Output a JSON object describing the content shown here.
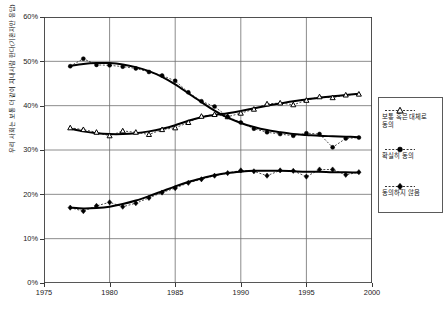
{
  "chart_data": {
    "type": "line",
    "title": "",
    "subtitle": "",
    "xlabel": "",
    "ylabel": "우리 사회는 보통 더 같이 지내사람 한다(기혼자만 응답)",
    "xlim": [
      1975,
      2000
    ],
    "ylim": [
      0,
      60
    ],
    "yticks": [
      0,
      10,
      20,
      30,
      40,
      50,
      60
    ],
    "ytick_labels": [
      "0%",
      "10%",
      "20%",
      "30%",
      "40%",
      "50%",
      "60%"
    ],
    "xticks": [
      1975,
      1980,
      1985,
      1990,
      1995,
      2000
    ],
    "xtick_labels": [
      "1975",
      "1980",
      "1985",
      "1990",
      "1995",
      "2000"
    ],
    "grid": true,
    "legend_position": "right",
    "x": [
      1977,
      1978,
      1979,
      1980,
      1981,
      1982,
      1983,
      1984,
      1985,
      1986,
      1987,
      1988,
      1989,
      1990,
      1991,
      1992,
      1993,
      1994,
      1995,
      1996,
      1997,
      1998,
      1999
    ],
    "series": [
      {
        "name": "보통 혹은 대체로 동의",
        "marker": "triangle-up",
        "line_style": "dashed",
        "values": [
          35.0,
          34.6,
          34.0,
          33.2,
          34.3,
          34.0,
          33.5,
          34.6,
          35.0,
          36.2,
          37.6,
          38.0,
          37.5,
          38.3,
          39.2,
          40.4,
          40.6,
          40.2,
          41.2,
          42.0,
          41.8,
          42.4,
          42.6
        ],
        "trend": [
          34.8,
          34.2,
          33.8,
          33.6,
          33.6,
          33.8,
          34.2,
          34.8,
          35.6,
          36.6,
          37.4,
          37.9,
          38.3,
          38.8,
          39.4,
          40.0,
          40.5,
          41.0,
          41.4,
          41.8,
          42.1,
          42.4,
          42.7
        ]
      },
      {
        "name": "확실히 동의",
        "marker": "circle",
        "line_style": "dashed",
        "values": [
          48.9,
          50.6,
          49.2,
          49.1,
          48.8,
          48.4,
          47.6,
          46.8,
          45.6,
          43.0,
          41.0,
          39.8,
          37.5,
          36.2,
          34.8,
          34.0,
          33.6,
          33.2,
          33.8,
          33.6,
          30.6,
          32.6,
          32.8
        ],
        "trend": [
          49.0,
          49.4,
          49.6,
          49.6,
          49.3,
          48.7,
          47.8,
          46.5,
          44.8,
          42.8,
          40.8,
          38.9,
          37.3,
          36.1,
          35.2,
          34.5,
          34.0,
          33.6,
          33.4,
          33.2,
          33.1,
          33.0,
          32.9
        ]
      },
      {
        "name": "동의하지 않음",
        "marker": "diamond",
        "line_style": "dashed",
        "values": [
          17.0,
          16.2,
          17.4,
          18.2,
          17.2,
          18.0,
          19.2,
          20.4,
          21.4,
          22.6,
          23.4,
          24.2,
          24.8,
          25.4,
          25.2,
          24.2,
          25.4,
          25.3,
          24.0,
          25.6,
          25.6,
          24.4,
          25.0
        ],
        "trend": [
          17.0,
          16.8,
          16.9,
          17.2,
          17.8,
          18.6,
          19.6,
          20.7,
          21.8,
          22.8,
          23.6,
          24.3,
          24.8,
          25.1,
          25.3,
          25.3,
          25.3,
          25.2,
          25.1,
          25.1,
          25.0,
          25.0,
          24.9
        ]
      }
    ]
  },
  "legend": {
    "entries": [
      {
        "label": "보통 혹은 대체로 동의"
      },
      {
        "label": "확실히 동의"
      },
      {
        "label": "동의하지 않음"
      }
    ]
  }
}
